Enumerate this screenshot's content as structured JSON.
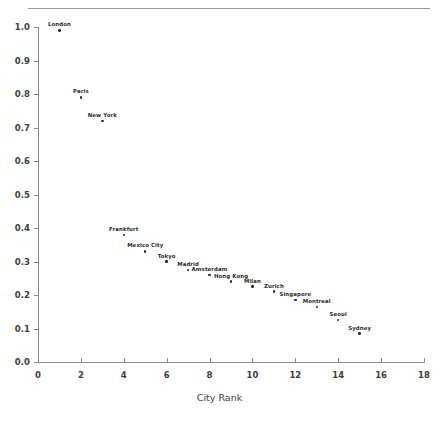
{
  "chart": {
    "type": "scatter",
    "title": "",
    "xlabel": "City Rank",
    "ylabel": ""
  },
  "chart_data": {
    "type": "scatter",
    "title": "",
    "xlabel": "City Rank",
    "ylabel": "",
    "xlim": [
      0,
      18.5
    ],
    "ylim": [
      0.0,
      1.03
    ],
    "grid": false,
    "legend": "none",
    "x_ticks": [
      0,
      2,
      4,
      6,
      8,
      10,
      12,
      14,
      16,
      18
    ],
    "x_tick_labels": [
      "0",
      "2",
      "4",
      "6",
      "8",
      "10",
      "12",
      "14",
      "16",
      "18"
    ],
    "y_ticks": [
      0.0,
      0.1,
      0.2,
      0.3,
      0.4,
      0.5,
      0.6,
      0.7,
      0.8,
      0.9,
      1.0
    ],
    "y_tick_labels": [
      "0.0",
      "0.1",
      "0.2",
      "0.3",
      "0.4",
      "0.5",
      "0.6",
      "0.7",
      "0.8",
      "0.9",
      "1.0"
    ],
    "point_color": "#2b2b2b",
    "points": [
      {
        "label": "London",
        "x": 1,
        "y": 0.99
      },
      {
        "label": "Paris",
        "x": 2,
        "y": 0.79
      },
      {
        "label": "New York",
        "x": 3,
        "y": 0.72
      },
      {
        "label": "Frankfurt",
        "x": 4,
        "y": 0.38
      },
      {
        "label": "Mexico City",
        "x": 5,
        "y": 0.33
      },
      {
        "label": "Tokyo",
        "x": 6,
        "y": 0.3
      },
      {
        "label": "Madrid",
        "x": 7,
        "y": 0.275
      },
      {
        "label": "Amsterdam",
        "x": 8,
        "y": 0.26
      },
      {
        "label": "Hong Kong",
        "x": 9,
        "y": 0.24
      },
      {
        "label": "Milan",
        "x": 10,
        "y": 0.225
      },
      {
        "label": "Zurich",
        "x": 11,
        "y": 0.21
      },
      {
        "label": "Singapore",
        "x": 12,
        "y": 0.185
      },
      {
        "label": "Montreal",
        "x": 13,
        "y": 0.165
      },
      {
        "label": "Seoul",
        "x": 14,
        "y": 0.125
      },
      {
        "label": "Sydney",
        "x": 15,
        "y": 0.085
      }
    ]
  }
}
